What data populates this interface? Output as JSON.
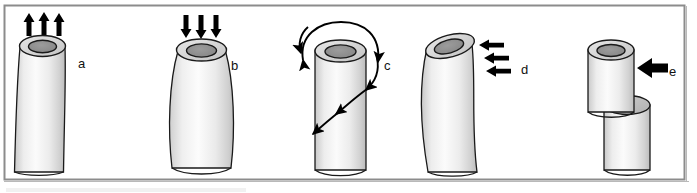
{
  "figure": {
    "frame": {
      "border_color": "#8c8c8c",
      "background_color": "#ffffff",
      "x": 4,
      "y": 5,
      "width": 681,
      "height": 175
    },
    "colors": {
      "outline": "#1a1a1a",
      "cylinder_body_light": "#f4f4f4",
      "cylinder_body_mid": "#e2e2e2",
      "cylinder_body_shade": "#c8c8c8",
      "rim_ring": "#d8d8d8",
      "bore_hole": "#8f8f8f",
      "shear_face": "#bdbdbd",
      "arrow": "#000000",
      "label": "#111111"
    },
    "panels": [
      {
        "id": "a",
        "label": "a",
        "label_x": 78,
        "label_y": 68,
        "loading": "tension",
        "arrow_count": 3,
        "arrow_direction": "up",
        "shape": "hourglass-necked cylinder (elongated, waisted)"
      },
      {
        "id": "b",
        "label": "b",
        "label_x": 231,
        "label_y": 70,
        "loading": "compression",
        "arrow_count": 3,
        "arrow_direction": "down",
        "shape": "barrel-shaped cylinder (bulged mid-span)"
      },
      {
        "id": "c",
        "label": "c",
        "label_x": 384,
        "label_y": 70,
        "loading": "torsion",
        "arrow_count": 2,
        "arrow_direction": "curved-spiral",
        "shape": "straight cylinder with helical twist arrows"
      },
      {
        "id": "d",
        "label": "d",
        "label_x": 521,
        "label_y": 74,
        "loading": "bending",
        "arrow_count": 3,
        "arrow_direction": "left",
        "shape": "curved/flexed cylinder"
      },
      {
        "id": "e",
        "label": "e",
        "label_x": 669,
        "label_y": 76,
        "loading": "shear",
        "arrow_count": 1,
        "arrow_direction": "left",
        "shape": "cylinder offset/sheared into two displaced segments"
      }
    ]
  }
}
